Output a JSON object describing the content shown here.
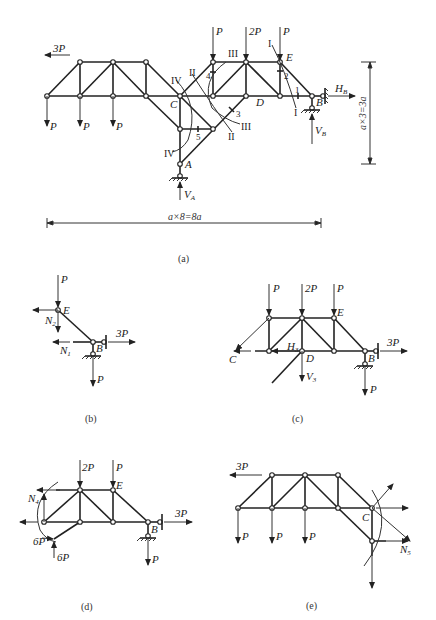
{
  "figure_a": {
    "caption": "(a)",
    "loads": {
      "left_horizontal": "3P",
      "top_1": "P",
      "top_2": "2P",
      "top_3": "P",
      "bottom_1": "P",
      "bottom_2": "P",
      "bottom_3": "P"
    },
    "nodes": {
      "A": "A",
      "B": "B",
      "C": "C",
      "D": "D",
      "E": "E"
    },
    "reactions": {
      "HB": "H",
      "HB_sub": "B",
      "VB": "V",
      "VB_sub": "B",
      "VA": "V",
      "VA_sub": "A"
    },
    "sections": [
      "I",
      "II",
      "III",
      "IV"
    ],
    "members": [
      "1",
      "2",
      "3",
      "4",
      "5"
    ],
    "dim_horizontal": "a×8=8a",
    "dim_vertical": "a×3=3a"
  },
  "figure_b": {
    "caption": "(b)",
    "loads": {
      "top": "P",
      "right": "3P",
      "bottom": "P"
    },
    "nodes": {
      "E": "E",
      "B": "B"
    },
    "forces": {
      "N2": "N",
      "N2_sub": "2",
      "N1": "N",
      "N1_sub": "1"
    }
  },
  "figure_c": {
    "caption": "(c)",
    "loads": {
      "top_1": "P",
      "top_2": "2P",
      "top_3": "P",
      "right": "3P",
      "bottom": "P"
    },
    "nodes": {
      "C": "C",
      "D": "D",
      "E": "E",
      "B": "B"
    },
    "forces": {
      "H3": "H",
      "H3_sub": "3",
      "V3": "V",
      "V3_sub": "3"
    }
  },
  "figure_d": {
    "caption": "(d)",
    "loads": {
      "top_1": "2P",
      "top_2": "P",
      "right": "3P",
      "bottom": "P",
      "force_h": "6P",
      "force_v": "6P"
    },
    "nodes": {
      "E": "E",
      "B": "B"
    },
    "forces": {
      "N4": "N",
      "N4_sub": "4"
    }
  },
  "figure_e": {
    "caption": "(e)",
    "loads": {
      "left": "3P",
      "bottom_1": "P",
      "bottom_2": "P",
      "bottom_3": "P"
    },
    "nodes": {
      "C": "C"
    },
    "forces": {
      "N5": "N",
      "N5_sub": "5"
    }
  }
}
